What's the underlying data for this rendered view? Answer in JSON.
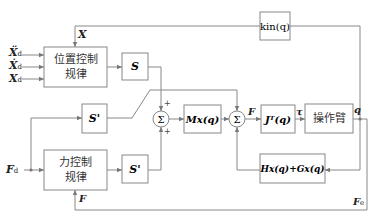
{
  "blocks": {
    "position_control": {
      "line1": "位置控制",
      "line2": "规律"
    },
    "force_control": {
      "line1": "力控制",
      "line2": "规律"
    },
    "s": "S",
    "s_prime_top": "S'",
    "s_prime_bottom": "S'",
    "mx": "Mx(q)",
    "jt": "Jᵀ(q)",
    "manipulator": "操作臂",
    "kin": "kin(q)",
    "hg": "Hx(q)+Gx(q)"
  },
  "inputs": {
    "xdd": "Ẍ",
    "xd_dot": "Ẋ",
    "xd": "X",
    "sub_d": "d",
    "fd": "F",
    "fd_sub": "d"
  },
  "signals": {
    "x_feedback": "X",
    "f_out": "F",
    "tau": "τ",
    "q": "q",
    "f_feedback": "F",
    "fe": "F",
    "fe_sub": "e"
  },
  "summers": {
    "symbol": "Σ",
    "plus": "+"
  }
}
